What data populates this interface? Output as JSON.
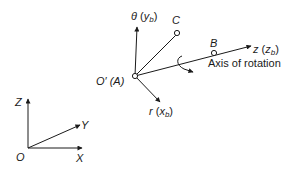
{
  "diagram": {
    "colors": {
      "stroke": "#1a1a1a",
      "background": "#ffffff"
    },
    "global_frame": {
      "origin_label": "O",
      "x_label": "X",
      "y_label": "Y",
      "z_label": "Z"
    },
    "body_frame": {
      "origin_label": "O′ (A)",
      "theta_axis": {
        "symbol": "θ",
        "paren_open": " (",
        "sub_base": "y",
        "sub": "b",
        "paren_close": ")"
      },
      "r_axis": {
        "symbol": "r",
        "paren_open": " (",
        "sub_base": "x",
        "sub": "b",
        "paren_close": ")"
      },
      "z_axis": {
        "symbol": "z",
        "paren_open": " (",
        "sub_base": "z",
        "sub": "b",
        "paren_close": ")"
      },
      "point_b_label": "B",
      "point_c_label": "C",
      "rotation_axis_label": "Axis of rotation"
    }
  }
}
